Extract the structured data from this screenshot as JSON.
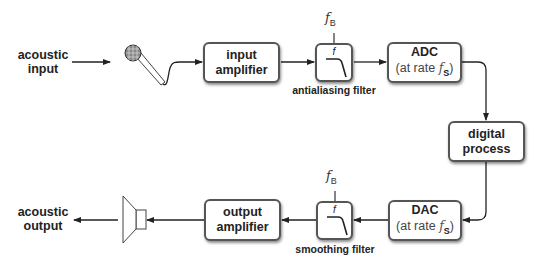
{
  "diagram": {
    "input": {
      "line1": "acoustic",
      "line2": "input"
    },
    "output": {
      "line1": "acoustic",
      "line2": "output"
    },
    "input_amplifier": {
      "line1": "input",
      "line2": "amplifier"
    },
    "output_amplifier": {
      "line1": "output",
      "line2": "amplifier"
    },
    "antialiasing_filter": {
      "caption": "antialiasing filter",
      "symbol": "f",
      "cutoff": "f",
      "cutoff_sub": "B"
    },
    "smoothing_filter": {
      "caption": "smoothing filter",
      "symbol": "f",
      "cutoff": "f",
      "cutoff_sub": "B"
    },
    "adc": {
      "line1": "ADC",
      "rate_prefix": "(at rate ",
      "rate_var": "f",
      "rate_sub": "S",
      "rate_suffix": ")"
    },
    "dac": {
      "line1": "DAC",
      "rate_prefix": "(at rate ",
      "rate_var": "f",
      "rate_sub": "S",
      "rate_suffix": ")"
    },
    "digital_process": {
      "line1": "digital",
      "line2": "process"
    },
    "icons": {
      "microphone": "microphone-icon",
      "speaker": "speaker-icon",
      "lowpass": "lowpass-filter-icon"
    },
    "colors": {
      "stroke": "#333333",
      "box_border": "#555555",
      "background": "#ffffff"
    }
  }
}
